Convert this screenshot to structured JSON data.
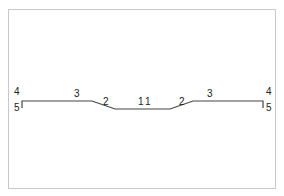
{
  "diagram": {
    "type": "profile-section",
    "line_color": "#444444",
    "frame_color": "#c8c8c8",
    "profile_points": [
      {
        "x": 22,
        "y": 108
      },
      {
        "x": 22,
        "y": 101
      },
      {
        "x": 92,
        "y": 101
      },
      {
        "x": 115,
        "y": 109
      },
      {
        "x": 170,
        "y": 109
      },
      {
        "x": 193,
        "y": 101
      },
      {
        "x": 263,
        "y": 101
      },
      {
        "x": 263,
        "y": 108
      }
    ],
    "labels": [
      {
        "id": "left-4",
        "text": "4",
        "x": 14,
        "y": 95
      },
      {
        "id": "left-5",
        "text": "5",
        "x": 14,
        "y": 111
      },
      {
        "id": "left-3",
        "text": "3",
        "x": 74,
        "y": 97
      },
      {
        "id": "left-2",
        "text": "2",
        "x": 103,
        "y": 105
      },
      {
        "id": "center-1a",
        "text": "1",
        "x": 138,
        "y": 105
      },
      {
        "id": "center-1b",
        "text": "1",
        "x": 145,
        "y": 105
      },
      {
        "id": "right-2",
        "text": "2",
        "x": 179,
        "y": 105
      },
      {
        "id": "right-3",
        "text": "3",
        "x": 207,
        "y": 97
      },
      {
        "id": "right-4",
        "text": "4",
        "x": 266,
        "y": 95
      },
      {
        "id": "right-5",
        "text": "5",
        "x": 266,
        "y": 111
      }
    ]
  }
}
